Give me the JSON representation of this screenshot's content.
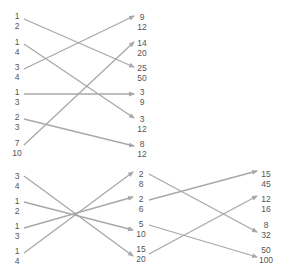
{
  "colors": {
    "line": "#a8a8a8",
    "text": "#555555"
  },
  "top_group": {
    "left": [
      {
        "num": "1",
        "den": "2",
        "x": 17,
        "y": 11
      },
      {
        "num": "1",
        "den": "4",
        "x": 17,
        "y": 37
      },
      {
        "num": "3",
        "den": "4",
        "x": 17,
        "y": 62
      },
      {
        "num": "1",
        "den": "3",
        "x": 17,
        "y": 87
      },
      {
        "num": "2",
        "den": "3",
        "x": 17,
        "y": 112
      },
      {
        "num": "7",
        "den": "10",
        "x": 17,
        "y": 138
      }
    ],
    "right": [
      {
        "num": "9",
        "den": "12",
        "x": 142,
        "y": 12
      },
      {
        "num": "14",
        "den": "20",
        "x": 142,
        "y": 38
      },
      {
        "num": "25",
        "den": "50",
        "x": 142,
        "y": 63
      },
      {
        "num": "3",
        "den": "9",
        "x": 142,
        "y": 87
      },
      {
        "num": "3",
        "den": "12",
        "x": 142,
        "y": 114
      },
      {
        "num": "8",
        "den": "12",
        "x": 142,
        "y": 139
      }
    ],
    "connections": [
      {
        "from": "1/2",
        "to": "25/50"
      },
      {
        "from": "1/4",
        "to": "3/12"
      },
      {
        "from": "3/4",
        "to": "9/12"
      },
      {
        "from": "1/3",
        "to": "3/9"
      },
      {
        "from": "2/3",
        "to": "8/12"
      },
      {
        "from": "7/10",
        "to": "14/20"
      }
    ]
  },
  "bottom_group": {
    "left": [
      {
        "num": "3",
        "den": "4",
        "x": 17,
        "y": 171
      },
      {
        "num": "1",
        "den": "2",
        "x": 17,
        "y": 196
      },
      {
        "num": "1",
        "den": "3",
        "x": 17,
        "y": 221
      },
      {
        "num": "1",
        "den": "4",
        "x": 17,
        "y": 246
      }
    ],
    "middle": [
      {
        "num": "2",
        "den": "8",
        "x": 141,
        "y": 169
      },
      {
        "num": "2",
        "den": "6",
        "x": 141,
        "y": 194
      },
      {
        "num": "5",
        "den": "10",
        "x": 141,
        "y": 219
      },
      {
        "num": "15",
        "den": "20",
        "x": 141,
        "y": 244
      }
    ],
    "right": [
      {
        "num": "15",
        "den": "45",
        "x": 266,
        "y": 169
      },
      {
        "num": "12",
        "den": "16",
        "x": 266,
        "y": 194
      },
      {
        "num": "8",
        "den": "32",
        "x": 266,
        "y": 220
      },
      {
        "num": "50",
        "den": "100",
        "x": 266,
        "y": 245
      }
    ],
    "connections_left_to_middle": [
      {
        "from": "3/4",
        "to": "15/20"
      },
      {
        "from": "1/2",
        "to": "5/10"
      },
      {
        "from": "1/3",
        "to": "2/6"
      },
      {
        "from": "1/4",
        "to": "2/8"
      }
    ],
    "connections_middle_to_right": [
      {
        "from": "2/8",
        "to": "8/32"
      },
      {
        "from": "2/6",
        "to": "15/45"
      },
      {
        "from": "5/10",
        "to": "50/100"
      },
      {
        "from": "15/20",
        "to": "12/16"
      }
    ]
  },
  "arrows": [
    {
      "x1": 24,
      "y1": 19,
      "x2": 134,
      "y2": 67
    },
    {
      "x1": 24,
      "y1": 44,
      "x2": 134,
      "y2": 118
    },
    {
      "x1": 24,
      "y1": 69,
      "x2": 134,
      "y2": 16
    },
    {
      "x1": 24,
      "y1": 94,
      "x2": 134,
      "y2": 94
    },
    {
      "x1": 24,
      "y1": 119,
      "x2": 134,
      "y2": 146
    },
    {
      "x1": 24,
      "y1": 145,
      "x2": 134,
      "y2": 42
    },
    {
      "x1": 24,
      "y1": 176,
      "x2": 133,
      "y2": 256
    },
    {
      "x1": 24,
      "y1": 202,
      "x2": 133,
      "y2": 230
    },
    {
      "x1": 24,
      "y1": 228,
      "x2": 133,
      "y2": 197
    },
    {
      "x1": 24,
      "y1": 253,
      "x2": 133,
      "y2": 172
    },
    {
      "x1": 149,
      "y1": 174,
      "x2": 257,
      "y2": 232
    },
    {
      "x1": 149,
      "y1": 200,
      "x2": 257,
      "y2": 171
    },
    {
      "x1": 149,
      "y1": 225,
      "x2": 257,
      "y2": 257
    },
    {
      "x1": 149,
      "y1": 254,
      "x2": 257,
      "y2": 196
    }
  ]
}
